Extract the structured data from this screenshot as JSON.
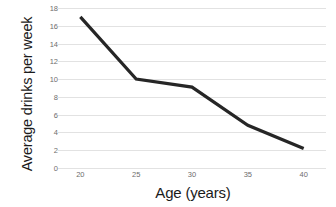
{
  "chart_data": {
    "type": "line",
    "title": "",
    "xlabel": "Age (years)",
    "ylabel": "Average drinks per week",
    "x": [
      20,
      25,
      30,
      35,
      40
    ],
    "values": [
      17,
      10,
      9.1,
      4.8,
      2.2
    ],
    "series": [
      {
        "name": "Average drinks per week",
        "values": [
          17,
          10,
          9.1,
          4.8,
          2.2
        ]
      }
    ],
    "xlim": [
      18,
      42
    ],
    "ylim": [
      0,
      18
    ],
    "xticks": [
      20,
      25,
      30,
      35,
      40
    ],
    "xtick_labels": [
      "20",
      "25",
      "30",
      "35",
      "40"
    ],
    "yticks": [
      0,
      2,
      4,
      6,
      8,
      10,
      12,
      14,
      16,
      18
    ],
    "ytick_labels": [
      "0",
      "2",
      "4",
      "6",
      "8",
      "10",
      "12",
      "14",
      "16",
      "18"
    ],
    "grid": "horizontal",
    "legend": "none",
    "line_color": "#262626",
    "grid_color": "#e2e2e2",
    "background_color": "#ffffff"
  }
}
